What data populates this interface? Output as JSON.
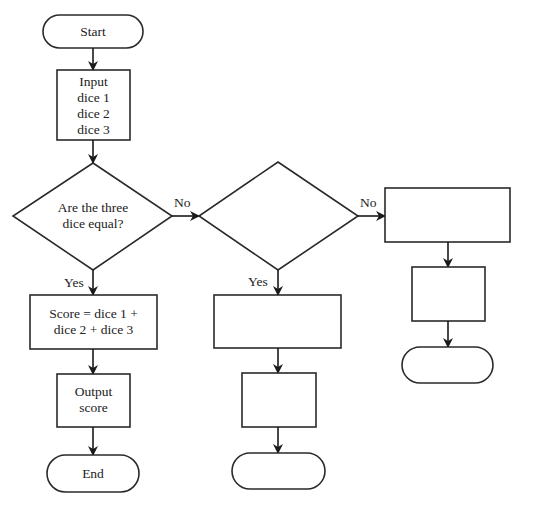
{
  "flowchart": {
    "start": {
      "label": "Start"
    },
    "input": {
      "lines": [
        "Input",
        "dice 1",
        "dice 2",
        "dice 3"
      ]
    },
    "decision1": {
      "lines": [
        "Are the three",
        "dice equal?"
      ]
    },
    "decision2": {
      "lines": []
    },
    "score": {
      "lines": [
        "Score = dice 1 +",
        "dice 2 + dice 3"
      ]
    },
    "output": {
      "lines": [
        "Output",
        "score"
      ]
    },
    "end": {
      "label": "End"
    },
    "middle_process1": {
      "label": ""
    },
    "middle_process2": {
      "label": ""
    },
    "middle_terminator": {
      "label": ""
    },
    "right_process1": {
      "label": ""
    },
    "right_process2": {
      "label": ""
    },
    "right_terminator": {
      "label": ""
    },
    "edges": {
      "d1_no": "No",
      "d1_yes": "Yes",
      "d2_no": "No",
      "d2_yes": "Yes"
    }
  }
}
